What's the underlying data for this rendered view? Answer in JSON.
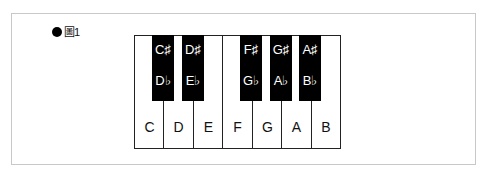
{
  "figure": {
    "bullet": "●",
    "label": "圖1"
  },
  "keyboard": {
    "white_keys": [
      {
        "note": "C"
      },
      {
        "note": "D"
      },
      {
        "note": "E"
      },
      {
        "note": "F"
      },
      {
        "note": "G"
      },
      {
        "note": "A"
      },
      {
        "note": "B"
      }
    ],
    "black_keys": [
      {
        "sharp": "C♯",
        "flat": "D♭"
      },
      {
        "sharp": "D♯",
        "flat": "E♭"
      },
      {
        "sharp": "F♯",
        "flat": "G♭"
      },
      {
        "sharp": "G♯",
        "flat": "A♭"
      },
      {
        "sharp": "A♯",
        "flat": "B♭"
      }
    ]
  },
  "colors": {
    "white_key": "#ffffff",
    "black_key": "#000000",
    "frame_border": "#c8c8c8"
  }
}
